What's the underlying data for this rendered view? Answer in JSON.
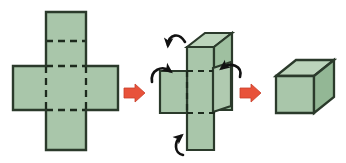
{
  "figure": {
    "title": "Folding a rectangular net into a box",
    "background_color": "#ffffff",
    "width": 346,
    "height": 163,
    "face_fill": "#a9c6aa",
    "face_fill_light": "#bcd4bb",
    "face_fill_dark": "#96b897",
    "edge_color": "#2b3a2b",
    "dashed_edge_color": "#1d2a1d",
    "arrow_color": "#e8523a",
    "fold_arrow_color": "#111111"
  },
  "panels": [
    {
      "id": "panel-net",
      "label": "flat-net",
      "description": "Flat cross-shaped net of six squares with dashed fold lines",
      "stage": 1,
      "faces": 6,
      "fold_lines": 5,
      "fold_line_style": "dashed"
    },
    {
      "id": "panel-partial-fold",
      "label": "partially-folded-net",
      "description": "Net partly folded upward with curved arrows indicating fold directions",
      "stage": 2,
      "fold_arrows": 4,
      "fold_arrow_directions": [
        "down-left",
        "right",
        "left",
        "up"
      ]
    },
    {
      "id": "panel-box",
      "label": "finished-box",
      "description": "Completed three dimensional rectangular box",
      "stage": 3,
      "visible_faces": 3,
      "visible_face_names": [
        "front",
        "top",
        "side"
      ]
    }
  ],
  "transition_arrows": [
    {
      "id": "arrow-1",
      "label": "net-to-partial",
      "direction": "right",
      "color": "#e8523a"
    },
    {
      "id": "arrow-2",
      "label": "partial-to-box",
      "direction": "right",
      "color": "#e8523a"
    }
  ],
  "fold_arrows": [
    {
      "id": "fold-arrow-top",
      "label": "top-flap-fold",
      "direction": "down-left"
    },
    {
      "id": "fold-arrow-left",
      "label": "left-flap-fold",
      "direction": "right"
    },
    {
      "id": "fold-arrow-right",
      "label": "right-flap-fold",
      "direction": "left"
    },
    {
      "id": "fold-arrow-bottom",
      "label": "bottom-flap-fold",
      "direction": "up"
    }
  ]
}
